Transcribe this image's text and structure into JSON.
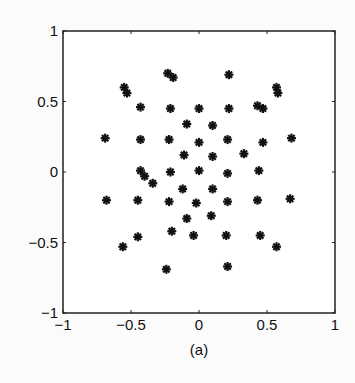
{
  "chart_data": {
    "type": "scatter",
    "title": "",
    "caption": "(a)",
    "xlabel": "",
    "ylabel": "",
    "xlim": [
      -1,
      1
    ],
    "ylim": [
      -1,
      1
    ],
    "xticks": [
      -1,
      -0.5,
      0,
      0.5,
      1
    ],
    "xtick_labels": [
      "−1",
      "−0.5",
      "0",
      "0.5",
      "1"
    ],
    "yticks": [
      -1,
      -0.5,
      0,
      0.5,
      1
    ],
    "ytick_labels": [
      "−1",
      "−0.5",
      "0",
      "0.5",
      "1"
    ],
    "grid": false,
    "legend": null,
    "marker": "asterisk",
    "marker_color": "#111111",
    "series": [
      {
        "name": "constellation",
        "points": [
          [
            -0.23,
            0.7
          ],
          [
            -0.19,
            0.67
          ],
          [
            0.22,
            0.69
          ],
          [
            -0.55,
            0.6
          ],
          [
            -0.53,
            0.56
          ],
          [
            0.57,
            0.6
          ],
          [
            0.58,
            0.56
          ],
          [
            -0.43,
            0.46
          ],
          [
            -0.21,
            0.45
          ],
          [
            0.0,
            0.45
          ],
          [
            0.22,
            0.45
          ],
          [
            0.43,
            0.47
          ],
          [
            0.47,
            0.45
          ],
          [
            -0.09,
            0.34
          ],
          [
            0.1,
            0.33
          ],
          [
            -0.69,
            0.24
          ],
          [
            -0.43,
            0.23
          ],
          [
            -0.22,
            0.23
          ],
          [
            0.0,
            0.21
          ],
          [
            0.21,
            0.23
          ],
          [
            0.47,
            0.21
          ],
          [
            0.68,
            0.24
          ],
          [
            -0.11,
            0.12
          ],
          [
            0.1,
            0.11
          ],
          [
            0.33,
            0.13
          ],
          [
            -0.43,
            0.01
          ],
          [
            -0.4,
            -0.03
          ],
          [
            -0.34,
            -0.08
          ],
          [
            -0.21,
            0.0
          ],
          [
            0.0,
            0.01
          ],
          [
            0.21,
            -0.01
          ],
          [
            0.44,
            0.01
          ],
          [
            -0.12,
            -0.12
          ],
          [
            0.1,
            -0.12
          ],
          [
            -0.68,
            -0.2
          ],
          [
            -0.45,
            -0.2
          ],
          [
            -0.22,
            -0.21
          ],
          [
            -0.02,
            -0.22
          ],
          [
            0.21,
            -0.21
          ],
          [
            0.43,
            -0.2
          ],
          [
            0.67,
            -0.19
          ],
          [
            -0.09,
            -0.33
          ],
          [
            0.09,
            -0.31
          ],
          [
            -0.45,
            -0.46
          ],
          [
            -0.2,
            -0.42
          ],
          [
            -0.04,
            -0.45
          ],
          [
            0.2,
            -0.45
          ],
          [
            0.45,
            -0.45
          ],
          [
            -0.56,
            -0.53
          ],
          [
            0.57,
            -0.53
          ],
          [
            -0.24,
            -0.69
          ],
          [
            0.21,
            -0.67
          ]
        ]
      }
    ]
  }
}
